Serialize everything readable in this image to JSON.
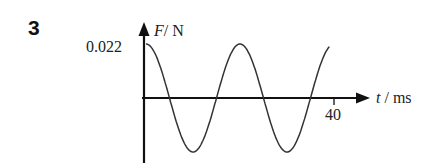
{
  "question_number": "3",
  "chart_data": {
    "type": "line",
    "title": "",
    "xlabel": "t / ms",
    "ylabel": "F/ N",
    "x_symbol": "t",
    "x_unit": "/ ms",
    "y_symbol": "F",
    "y_unit": "/ N",
    "y_tick_labels": [
      "0.022"
    ],
    "x_tick_labels": [
      "40"
    ],
    "series": [
      {
        "name": "F",
        "function": "0.022*cos(2*pi*t/20)",
        "amplitude": 0.022,
        "period_ms": 20,
        "x": [
          0,
          5,
          10,
          15,
          20,
          25,
          30,
          35,
          39
        ],
        "values": [
          0.022,
          0,
          -0.022,
          0,
          0.022,
          0,
          -0.022,
          0,
          0.021
        ]
      }
    ],
    "xlim": [
      0,
      47
    ],
    "ylim": [
      -0.026,
      0.026
    ],
    "grid": false,
    "legend": null
  }
}
